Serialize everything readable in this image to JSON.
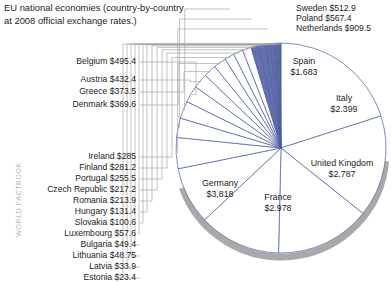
{
  "title": "EU national economies (country-by-country\nat 2008 official exchange rates.)",
  "watermark": "WORLD FACTBOOK",
  "colors": {
    "slice_stroke": "#4a5c9e",
    "slice_fill_white": "#ffffff",
    "slice_fill_blue": "#41539b",
    "leader_line": "#a8a8a8",
    "shadow": "#8c8c8c",
    "text": "#1c1c1c",
    "watermark": "#b9b9b9"
  },
  "chart_data": {
    "type": "pie",
    "title": "EU national economies (country-by-country at 2008 official exchange rates.)",
    "unit": "billions/trillions of US dollars at official exchange rates",
    "legend": "labels-with-leader-lines",
    "grid": false,
    "center": {
      "x": 281,
      "y": 148
    },
    "radius": 105,
    "start_angle_deg": 0,
    "labels": [
      "Germany",
      "France",
      "United Kingdom",
      "Italy",
      "Spain",
      "Netherlands",
      "Poland",
      "Sweden",
      "Belgium",
      "Austria",
      "Greece",
      "Denmark",
      "Ireland",
      "Finland",
      "Portugal",
      "Czech Republic",
      "Romania",
      "Hungary",
      "Slovakia",
      "Luxembourg",
      "Bulgaria",
      "Lithuania",
      "Latvia",
      "Estonia"
    ],
    "values": [
      3818,
      2978,
      2787,
      2399,
      1683,
      909.5,
      567.4,
      512.9,
      495.4,
      432.4,
      373.5,
      369.6,
      285,
      281.2,
      255.5,
      217.2,
      213.9,
      131.4,
      100.6,
      57.6,
      49.4,
      48.75,
      33.9,
      23.4
    ],
    "value_labels": [
      "$3,818",
      "$2.978",
      "$2.787",
      "$2.399",
      "$1.683",
      "$909.5",
      "$567.4",
      "$512.9",
      "$495.4",
      "$432.4",
      "$373.5",
      "$369.6",
      "$285",
      "$281.2",
      "$255.5",
      "$217.2",
      "$213.9",
      "$131.4",
      "$100.6",
      "$57.6",
      "$49.4",
      "$48.75",
      "$33.9",
      "$23.4"
    ]
  },
  "slice_labels": [
    {
      "name": "Spain",
      "value": "$1.683"
    },
    {
      "name": "Italy",
      "value": "$2.399"
    },
    {
      "name": "United Kingdom",
      "value": "$2.787"
    },
    {
      "name": "France",
      "value": "$2.978"
    },
    {
      "name": "Germany",
      "value": "$3,818"
    }
  ],
  "callouts_top_right": [
    {
      "name": "Sweden",
      "value": "$512.9"
    },
    {
      "name": "Poland",
      "value": "$567.4"
    },
    {
      "name": "Netherlands",
      "value": "$909.5"
    }
  ],
  "callouts_left": [
    {
      "name": "Belgium",
      "value": "$495.4"
    },
    {
      "name": "Austria",
      "value": "$432.4"
    },
    {
      "name": "Greece",
      "value": "$373.5"
    },
    {
      "name": "Denmark",
      "value": "$369.6"
    },
    {
      "name": "Ireland",
      "value": "$285"
    },
    {
      "name": "Finland",
      "value": "$281.2"
    },
    {
      "name": "Portugal",
      "value": "$255.5"
    },
    {
      "name": "Czech Republic",
      "value": "$217.2"
    },
    {
      "name": "Romania",
      "value": "$213.9"
    },
    {
      "name": "Hungary",
      "value": "$131.4"
    },
    {
      "name": "Slovakia",
      "value": "$100.6"
    },
    {
      "name": "Luxembourg",
      "value": "$57.6"
    },
    {
      "name": "Bulgaria",
      "value": "$49.4"
    },
    {
      "name": "Lithuania",
      "value": "$48.75"
    },
    {
      "name": "Latvia",
      "value": "$33.9"
    },
    {
      "name": "Estonia",
      "value": "$23.4"
    }
  ]
}
